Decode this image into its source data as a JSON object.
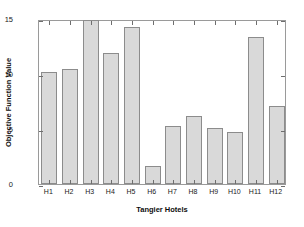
{
  "chart_data": {
    "type": "bar",
    "title": "",
    "xlabel": "Tangier Hotels",
    "ylabel": "Objective Function Value",
    "categories": [
      "H1",
      "H2",
      "H3",
      "H4",
      "H5",
      "H6",
      "H7",
      "H8",
      "H9",
      "H10",
      "H11",
      "H12"
    ],
    "values": [
      10.2,
      10.5,
      14.9,
      11.9,
      14.3,
      1.6,
      5.3,
      6.2,
      5.1,
      4.7,
      13.4,
      7.1
    ],
    "ylim": [
      0,
      15
    ],
    "yticks": [
      0,
      5,
      10,
      15
    ],
    "ytick_labels": [
      "0",
      "5",
      "10",
      "15"
    ],
    "grid": false,
    "legend": false,
    "bar_fill_color": "#d9d9d9",
    "bar_edge_color": "#8c8c8c",
    "axis_color": "#9a9a9a",
    "background_color": "#ffffff"
  }
}
